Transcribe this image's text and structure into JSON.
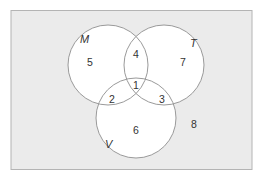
{
  "diagram": {
    "type": "venn-3",
    "universe": {
      "fill": "#ebebeb",
      "stroke": "#b4b4b4",
      "outside_value": "8"
    },
    "sets": [
      {
        "name": "M"
      },
      {
        "name": "T"
      },
      {
        "name": "V"
      }
    ],
    "regions": {
      "M_only": "5",
      "T_only": "7",
      "V_only": "6",
      "M_and_T_only": "4",
      "M_and_V_only": "2",
      "T_and_V_only": "3",
      "M_and_T_and_V": "1",
      "outside": "8"
    },
    "circle_fill": "#ffffff",
    "circle_stroke": "#9a9a9a"
  }
}
